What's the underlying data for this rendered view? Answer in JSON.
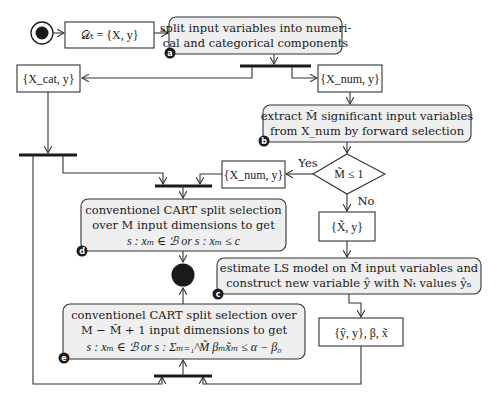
{
  "diagram": {
    "type": "activity-diagram",
    "start_node": {
      "label": "start"
    },
    "end_node": {
      "label": "end"
    },
    "data_nodes": {
      "dataset": "𝒟ₜ = {X, y}",
      "categorical": "{X_cat, y}",
      "numerical": "{X_num, y}",
      "numerical_yes": "{X_num, y}",
      "selected": "{X̃, y}",
      "result": "{ŷ, y}, β, x̃"
    },
    "actions": {
      "a": {
        "badge": "a",
        "line1": "split input variables into numeri-",
        "line2": "cal and categorical components"
      },
      "b": {
        "badge": "b",
        "line1": "extract M̃ significant input variables",
        "line2": "from X_num by forward selection"
      },
      "c": {
        "badge": "c",
        "line1": "estimate LS model on M̃ input variables and",
        "line2": "construct new variable ŷ with Nₜ values ŷₙ"
      },
      "d": {
        "badge": "d",
        "line1": "conventionel CART split selection",
        "line2": "over M input dimensions to get",
        "line3": "s : xₘ ∈ ℬ   or   s : xₘ ≤ c"
      },
      "e": {
        "badge": "e",
        "line1": "conventionel CART split selection over",
        "line2": "M − M̃ + 1 input dimensions to get",
        "line3": "s : xₘ ∈ ℬ  or  s : Σₘ₌₁^M̃ βₘx̃ₘ ≤ α − β₀"
      }
    },
    "decision": {
      "condition": "M̃ ≤ 1",
      "yes_label": "Yes",
      "no_label": "No"
    }
  }
}
